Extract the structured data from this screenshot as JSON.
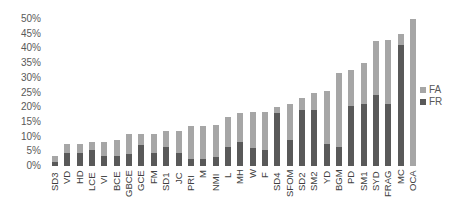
{
  "chart_data": {
    "type": "bar",
    "stacked": true,
    "title": "",
    "xlabel": "",
    "ylabel": "",
    "ylim": [
      0,
      50
    ],
    "yticks": [
      "0%",
      "5%",
      "10%",
      "15%",
      "20%",
      "25%",
      "30%",
      "35%",
      "40%",
      "45%",
      "50%"
    ],
    "grid": false,
    "legend_position": "right",
    "categories": [
      "SD3",
      "VD",
      "HD",
      "LCE",
      "VI",
      "BCE",
      "GBCE",
      "GCE",
      "FM",
      "SD1",
      "JC",
      "PRI",
      "M",
      "NMI",
      "L",
      "MH",
      "W",
      "F",
      "SD4",
      "SFOM",
      "SD2",
      "SM2",
      "YD",
      "BGM",
      "PD",
      "SM1",
      "SYD",
      "FRAG",
      "MC",
      "OCA"
    ],
    "series": [
      {
        "name": "FR",
        "color": "#595959",
        "values": [
          1.5,
          4.5,
          4.5,
          5.5,
          3.5,
          3.5,
          4,
          7,
          4.5,
          6.5,
          4.5,
          2.5,
          2.5,
          3,
          6.5,
          8,
          6,
          5.5,
          18,
          9,
          19,
          19,
          7.5,
          6.5,
          20.5,
          21,
          24,
          21,
          41,
          0
        ]
      },
      {
        "name": "FA",
        "color": "#a6a6a6",
        "values": [
          2,
          3,
          3,
          2.5,
          4.5,
          5.5,
          7,
          4,
          6.5,
          5.5,
          7.5,
          11,
          11,
          11,
          10,
          10,
          12.5,
          13,
          2,
          12,
          4,
          6,
          18,
          25,
          12,
          14,
          18.5,
          22,
          4,
          50
        ]
      }
    ],
    "totals": [
      3.5,
      7.5,
      7.5,
      8,
      8,
      9,
      11,
      11,
      11,
      12,
      12,
      13.5,
      13.5,
      14,
      16.5,
      18,
      18.5,
      18.5,
      20,
      21,
      23,
      25,
      25.5,
      31.5,
      32.5,
      35,
      42.5,
      43,
      45,
      50
    ]
  },
  "legend": {
    "items": [
      {
        "label": "FA",
        "color": "#a6a6a6"
      },
      {
        "label": "FR",
        "color": "#595959"
      }
    ]
  }
}
